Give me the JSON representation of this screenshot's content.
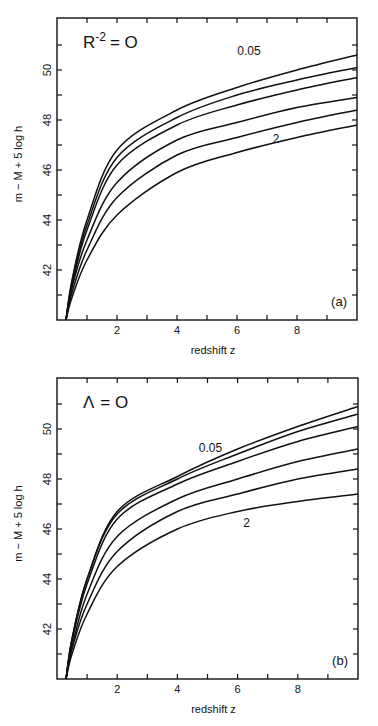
{
  "chart_data": [
    {
      "type": "line",
      "panel_label": "(a)",
      "title": "R^-2 = 0",
      "title_main": "R",
      "title_sup": "-2",
      "title_rest": "= O",
      "xlabel": "redshift  z",
      "ylabel": "m − M + 5 log h",
      "xlim": [
        0,
        10
      ],
      "ylim": [
        40,
        52.1
      ],
      "x_ticks": [
        2,
        4,
        6,
        8
      ],
      "y_ticks": [
        42,
        44,
        46,
        48,
        50
      ],
      "grid": false,
      "legend": "none",
      "annotations": [
        {
          "text": "0.05",
          "x": 6.4,
          "y": 50.6
        },
        {
          "text": "2",
          "x": 7.3,
          "y": 47.1
        }
      ],
      "x": [
        0.3,
        0.5,
        1,
        2,
        4,
        6,
        8,
        10
      ],
      "series": [
        {
          "name": "0.05",
          "values": [
            40.0,
            41.6,
            44.0,
            46.8,
            48.4,
            49.3,
            50.0,
            50.6
          ]
        },
        {
          "name": "curve-2",
          "values": [
            40.0,
            41.5,
            43.8,
            46.5,
            48.1,
            49.0,
            49.6,
            50.1
          ]
        },
        {
          "name": "curve-3",
          "values": [
            40.0,
            41.4,
            43.6,
            46.2,
            47.8,
            48.6,
            49.2,
            49.7
          ]
        },
        {
          "name": "curve-4",
          "values": [
            40.0,
            41.3,
            43.2,
            45.5,
            47.2,
            47.9,
            48.5,
            48.9
          ]
        },
        {
          "name": "curve-5",
          "values": [
            40.0,
            41.1,
            42.8,
            44.9,
            46.6,
            47.3,
            47.9,
            48.4
          ]
        },
        {
          "name": "2",
          "values": [
            40.0,
            40.9,
            42.4,
            44.2,
            45.9,
            46.7,
            47.3,
            47.8
          ]
        }
      ]
    },
    {
      "type": "line",
      "panel_label": "(b)",
      "title": "Λ = 0",
      "title_main": "Λ",
      "title_sup": "",
      "title_rest": "= O",
      "xlabel": "redshift  z",
      "ylabel": "m − M + 5 log h",
      "xlim": [
        0,
        10
      ],
      "ylim": [
        40,
        52.0
      ],
      "x_ticks": [
        2,
        4,
        6,
        8
      ],
      "y_ticks": [
        42,
        44,
        46,
        48,
        50
      ],
      "grid": false,
      "legend": "none",
      "annotations": [
        {
          "text": "0.05",
          "x": 5.1,
          "y": 49.1
        },
        {
          "text": "2",
          "x": 6.3,
          "y": 46.1
        }
      ],
      "x": [
        0.3,
        0.5,
        1,
        2,
        4,
        6,
        8,
        10
      ],
      "series": [
        {
          "name": "0.05",
          "values": [
            40.0,
            41.6,
            44.0,
            46.7,
            48.1,
            49.2,
            50.1,
            50.9
          ]
        },
        {
          "name": "curve-2",
          "values": [
            40.0,
            41.6,
            44.0,
            46.6,
            48.0,
            49.0,
            49.9,
            50.6
          ]
        },
        {
          "name": "curve-3",
          "values": [
            40.0,
            41.5,
            43.8,
            46.4,
            47.8,
            48.7,
            49.5,
            50.1
          ]
        },
        {
          "name": "curve-4",
          "values": [
            40.0,
            41.3,
            43.4,
            45.7,
            47.2,
            48.0,
            48.7,
            49.2
          ]
        },
        {
          "name": "curve-5",
          "values": [
            40.0,
            41.2,
            43.0,
            45.1,
            46.7,
            47.4,
            48.0,
            48.4
          ]
        },
        {
          "name": "2",
          "values": [
            40.0,
            41.0,
            42.6,
            44.5,
            46.0,
            46.7,
            47.1,
            47.4
          ]
        }
      ]
    }
  ],
  "layout": {
    "panels": [
      {
        "left": 57,
        "right": 357,
        "top": 18,
        "bottom": 320
      },
      {
        "left": 57,
        "right": 358,
        "top": 378,
        "bottom": 679
      }
    ]
  }
}
